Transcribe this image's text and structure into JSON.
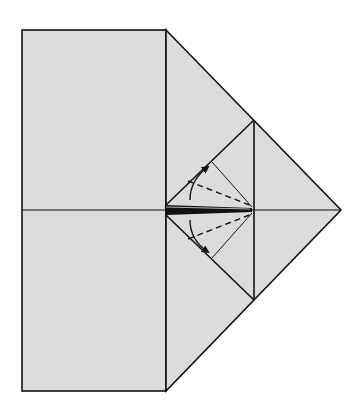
{
  "diagram": {
    "type": "origami-fold-diagram",
    "colors": {
      "paper": "#dcdcdc",
      "line": "#111111",
      "background": "#ffffff"
    },
    "elements": {
      "main_square": "square panel",
      "right_flap": "folded triangular point",
      "inner_diamond": "inner square diamond",
      "center_crease": "horizontal crease line",
      "upper_flap": "upper small triangular flap",
      "lower_flap": "lower small triangular flap",
      "upper_valley_fold": "dashed valley fold line",
      "lower_valley_fold": "dashed valley fold line",
      "upper_arrow": "curved fold arrow upward",
      "lower_arrow": "curved fold arrow downward"
    }
  }
}
